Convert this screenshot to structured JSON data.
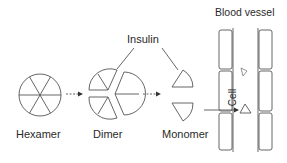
{
  "diagram": {
    "labels": {
      "hexamer": "Hexamer",
      "dimer": "Dimer",
      "monomer": "Monomer",
      "insulin": "Insulin",
      "blood_vessel": "Blood vessel",
      "cell": "Cell"
    },
    "stages": [
      "Hexamer",
      "Dimer",
      "Monomer"
    ],
    "colors": {
      "stroke": "#555555",
      "text": "#2a2a2a"
    }
  }
}
